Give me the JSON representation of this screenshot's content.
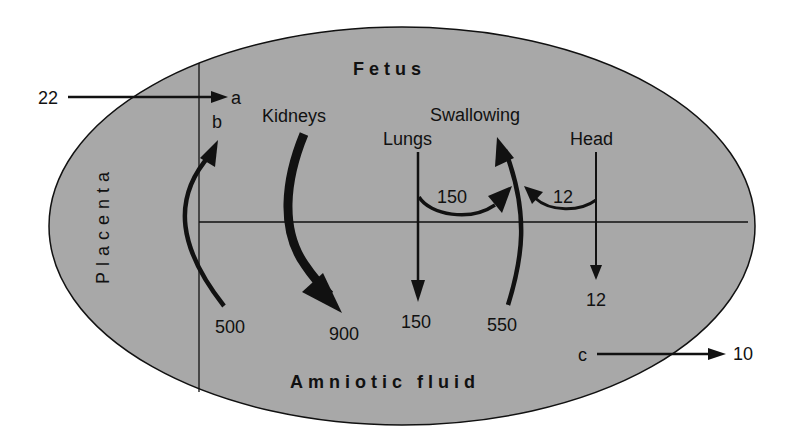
{
  "colors": {
    "ellipse_fill": "#a8a8a8",
    "stroke": "#111111",
    "background": "#ffffff"
  },
  "regions": {
    "fetus": "Fetus",
    "amniotic_fluid": "Amniotic fluid",
    "placenta": "Placenta"
  },
  "sources": {
    "kidneys": "Kidneys",
    "lungs": "Lungs",
    "swallowing": "Swallowing",
    "head": "Head"
  },
  "letters": {
    "a": "a",
    "b": "b",
    "c": "c"
  },
  "flows": {
    "input_to_a": "22",
    "placenta_to_fetus": "500",
    "kidneys_to_fluid": "900",
    "lungs_to_fluid": "150",
    "lungs_to_swallowing": "150",
    "swallowing_from_fluid": "550",
    "head_to_swallowing": "12",
    "head_to_fluid": "12",
    "c_output": "10"
  }
}
